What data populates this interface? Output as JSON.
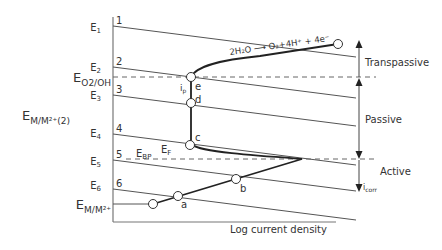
{
  "diagram": {
    "axes": {
      "xlabel": "Log current density"
    },
    "left_labels": {
      "E1": {
        "base": "E",
        "sub": "1"
      },
      "E2": {
        "base": "E",
        "sub": "2"
      },
      "EO2OH": {
        "base": "E",
        "sub": "O2/OH"
      },
      "E3": {
        "base": "E",
        "sub": "3"
      },
      "EMM2_2": {
        "base": "E",
        "sub": "M/M²⁺(2)"
      },
      "E4": {
        "base": "E",
        "sub": "4"
      },
      "E5": {
        "base": "E",
        "sub": "5"
      },
      "E6": {
        "base": "E",
        "sub": "6"
      },
      "EMM2": {
        "base": "E",
        "sub": "M/M²⁺"
      }
    },
    "line_numbers": [
      "1",
      "2",
      "3",
      "4",
      "5",
      "6"
    ],
    "point_labels": {
      "a": "a",
      "b": "b",
      "c": "c",
      "d": "d",
      "e": "e",
      "ip_base": "i",
      "ip_sub": "p"
    },
    "annotations": {
      "EBP_base": "E",
      "EBP_sub": "BP",
      "EF_base": "E",
      "EF_sub": "F",
      "reaction": "2H₂O ⟶ O₂+4H⁺ + 4e⁻",
      "icorr_base": "i",
      "icorr_sub": "corr"
    },
    "regions": {
      "transpassive": "Transpassive",
      "passive": "Passive",
      "active": "Active"
    },
    "colors": {
      "line": "#555555",
      "curve": "#222222",
      "text": "#333333",
      "background": "#ffffff"
    }
  }
}
